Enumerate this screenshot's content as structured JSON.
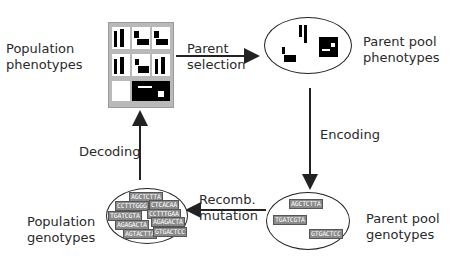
{
  "diagram": {
    "type": "genetic-algorithm-cycle",
    "nodes": {
      "population_phenotypes": {
        "label": "Population\nphenotypes"
      },
      "parent_pool_phenotypes": {
        "label": "Parent pool\nphenotypes"
      },
      "parent_pool_genotypes": {
        "label": "Parent pool\ngenotypes",
        "sequences": [
          "AGCTCTTA",
          "TGATCGTA",
          "GTGACTCC"
        ]
      },
      "population_genotypes": {
        "label": "Population\ngenotypes",
        "sequences": [
          "AGCTCTTA",
          "CCTTTGGG",
          "CTCACAA",
          "TGATCGTA",
          "CCTTTGAA",
          "AGAGACTA",
          "AGAGACTA",
          "AGTACTTA",
          "GTGACTCC"
        ]
      }
    },
    "edges": [
      {
        "from": "population_phenotypes",
        "to": "parent_pool_phenotypes",
        "label": "Parent\nselection"
      },
      {
        "from": "parent_pool_phenotypes",
        "to": "parent_pool_genotypes",
        "label": "Encoding"
      },
      {
        "from": "parent_pool_genotypes",
        "to": "population_genotypes",
        "label": "Recomb.\nmutation"
      },
      {
        "from": "population_genotypes",
        "to": "population_phenotypes",
        "label": "Decoding"
      }
    ],
    "colors": {
      "line": "#222222",
      "sequence_bg": "#8a8a8a",
      "panel_bg": "#b9b9b9"
    }
  }
}
